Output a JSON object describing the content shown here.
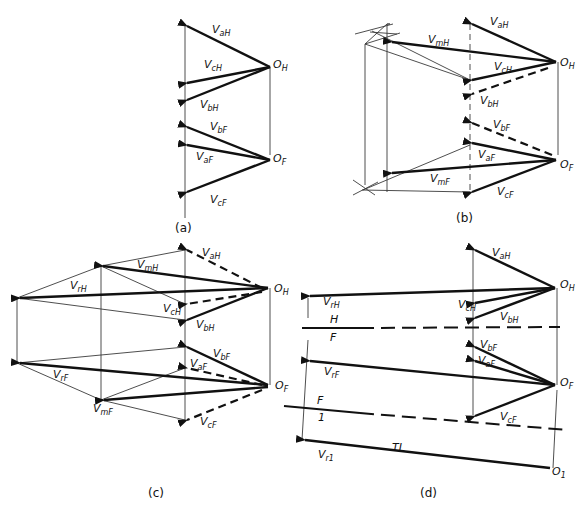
{
  "figure": {
    "panels": [
      {
        "id": "a",
        "caption": "(a)",
        "labels": {
          "v_aH": [
            "V",
            "aH"
          ],
          "v_cH": [
            "V",
            "cH"
          ],
          "v_bH": [
            "V",
            "bH"
          ],
          "o_H": [
            "O",
            "H"
          ],
          "v_bF": [
            "V",
            "bF"
          ],
          "v_aF": [
            "V",
            "aF"
          ],
          "v_cF": [
            "V",
            "cF"
          ],
          "o_F": [
            "O",
            "F"
          ]
        }
      },
      {
        "id": "b",
        "caption": "(b)",
        "labels": {
          "v_aH": [
            "V",
            "aH"
          ],
          "v_mH": [
            "V",
            "mH"
          ],
          "v_cH": [
            "V",
            "cH"
          ],
          "v_bH": [
            "V",
            "bH"
          ],
          "o_H": [
            "O",
            "H"
          ],
          "v_bF": [
            "V",
            "bF"
          ],
          "v_aF": [
            "V",
            "aF"
          ],
          "v_mF": [
            "V",
            "mF"
          ],
          "v_cF": [
            "V",
            "cF"
          ],
          "o_F": [
            "O",
            "F"
          ]
        }
      },
      {
        "id": "c",
        "caption": "(c)",
        "labels": {
          "v_aH": [
            "V",
            "aH"
          ],
          "v_mH": [
            "V",
            "mH"
          ],
          "v_rH": [
            "V",
            "rH"
          ],
          "v_cH": [
            "V",
            "cH"
          ],
          "v_bH": [
            "V",
            "bH"
          ],
          "o_H": [
            "O",
            "H"
          ],
          "v_bF": [
            "V",
            "bF"
          ],
          "v_aF": [
            "V",
            "aF"
          ],
          "v_rF": [
            "V",
            "rF"
          ],
          "v_mF": [
            "V",
            "mF"
          ],
          "v_cF": [
            "V",
            "cF"
          ],
          "o_F": [
            "O",
            "F"
          ]
        }
      },
      {
        "id": "d",
        "caption": "(d)",
        "labels": {
          "v_aH": [
            "V",
            "aH"
          ],
          "v_rH": [
            "V",
            "rH"
          ],
          "v_cH": [
            "V",
            "cH"
          ],
          "v_bH": [
            "V",
            "bH"
          ],
          "o_H": [
            "O",
            "H"
          ],
          "ref_HF_top": "H",
          "ref_HF_bottom": "F",
          "v_bF": [
            "V",
            "bF"
          ],
          "v_aF": [
            "V",
            "aF"
          ],
          "v_rF": [
            "V",
            "rF"
          ],
          "v_cF": [
            "V",
            "cF"
          ],
          "o_F": [
            "O",
            "F"
          ],
          "ref_F1_top": "F",
          "ref_F1_bottom": "1",
          "tl": "TL",
          "v_r1": [
            "V",
            "r1"
          ],
          "o_1": [
            "O",
            "1"
          ]
        }
      }
    ]
  }
}
